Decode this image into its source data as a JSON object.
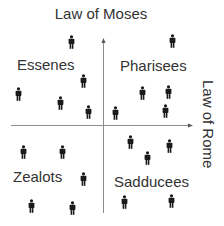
{
  "diagram": {
    "axes": {
      "vertical_label": "Law of Moses",
      "horizontal_label": "Law of Rome",
      "color": "#8c8c8c"
    },
    "quadrants": [
      {
        "id": "top-left",
        "label": "Essenes",
        "label_pos": [
          17,
          57
        ]
      },
      {
        "id": "top-right",
        "label": "Pharisees",
        "label_pos": [
          120,
          58
        ]
      },
      {
        "id": "bottom-left",
        "label": "Zealots",
        "label_pos": [
          13,
          168
        ]
      },
      {
        "id": "bottom-right",
        "label": "Sadducees",
        "label_pos": [
          114,
          174
        ]
      }
    ],
    "person_icon": {
      "name": "person-icon",
      "color": "#1a1a1a"
    },
    "people": [
      {
        "quadrant": "Essenes",
        "x": 71,
        "y": 35
      },
      {
        "quadrant": "Essenes",
        "x": 83,
        "y": 74
      },
      {
        "quadrant": "Essenes",
        "x": 18,
        "y": 87
      },
      {
        "quadrant": "Essenes",
        "x": 60,
        "y": 96
      },
      {
        "quadrant": "Essenes",
        "x": 88,
        "y": 105
      },
      {
        "quadrant": "Pharisees",
        "x": 172,
        "y": 34
      },
      {
        "quadrant": "Pharisees",
        "x": 142,
        "y": 86
      },
      {
        "quadrant": "Pharisees",
        "x": 168,
        "y": 85
      },
      {
        "quadrant": "Pharisees",
        "x": 115,
        "y": 106
      },
      {
        "quadrant": "Pharisees",
        "x": 165,
        "y": 104
      },
      {
        "quadrant": "Zealots",
        "x": 23,
        "y": 145
      },
      {
        "quadrant": "Zealots",
        "x": 62,
        "y": 145
      },
      {
        "quadrant": "Zealots",
        "x": 83,
        "y": 172
      },
      {
        "quadrant": "Zealots",
        "x": 31,
        "y": 199
      },
      {
        "quadrant": "Zealots",
        "x": 72,
        "y": 201
      },
      {
        "quadrant": "Sadducees",
        "x": 130,
        "y": 135
      },
      {
        "quadrant": "Sadducees",
        "x": 169,
        "y": 139
      },
      {
        "quadrant": "Sadducees",
        "x": 147,
        "y": 151
      },
      {
        "quadrant": "Sadducees",
        "x": 124,
        "y": 195
      },
      {
        "quadrant": "Sadducees",
        "x": 171,
        "y": 194
      }
    ]
  }
}
